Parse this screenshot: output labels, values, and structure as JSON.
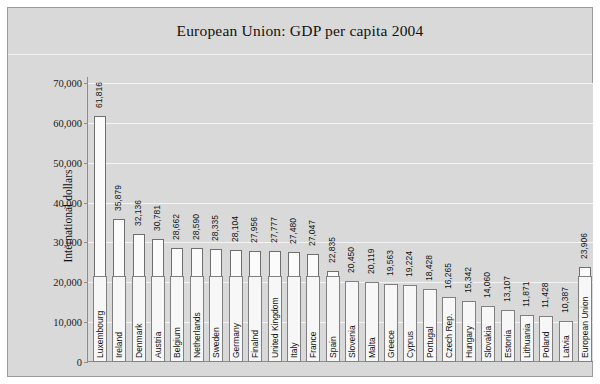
{
  "chart_data": {
    "type": "bar",
    "title": "European Union: GDP per capita 2004",
    "xlabel": "",
    "ylabel": "International dollars",
    "ylim": [
      0,
      70000
    ],
    "ytick_values": [
      0,
      10000,
      20000,
      30000,
      40000,
      50000,
      60000,
      70000
    ],
    "ytick_labels": [
      "0",
      "10,000",
      "20,000",
      "30,000",
      "40,000",
      "50,000",
      "60,000",
      "70,000"
    ],
    "grid": true,
    "legend": "none",
    "bar_color": "#fbfbfb",
    "bar_edge_color": "#6f6f6f",
    "background_color": "#d9d9d9",
    "categories": [
      "Luxembourg",
      "Ireland",
      "Denmark",
      "Austria",
      "Belgium",
      "Netherlands",
      "Sweden",
      "Germany",
      "Finalnd",
      "United Kingdom",
      "Italy",
      "France",
      "Spain",
      "Slovenia",
      "Malta",
      "Greece",
      "Cyprus",
      "Portugal",
      "Czech Rep.",
      "Hungary",
      "Slovakia",
      "Estonia",
      "Lithuania",
      "Poland",
      "Latvia",
      "European Union"
    ],
    "values": [
      61816,
      35879,
      32136,
      30781,
      28662,
      28590,
      28335,
      28104,
      27956,
      27777,
      27480,
      27047,
      22835,
      20450,
      20119,
      19563,
      19224,
      18428,
      16265,
      15342,
      14060,
      13107,
      11871,
      11428,
      10387,
      23906
    ],
    "value_labels": [
      "61,816",
      "35,879",
      "32,136",
      "30,781",
      "28,662",
      "28,590",
      "28,335",
      "28,104",
      "27,956",
      "27,777",
      "27,480",
      "27,047",
      "22,835",
      "20,450",
      "20,119",
      "19,563",
      "19,224",
      "18,428",
      "16,265",
      "15,342",
      "14,060",
      "13,107",
      "11,871",
      "11,428",
      "10,387",
      "23,906"
    ]
  }
}
